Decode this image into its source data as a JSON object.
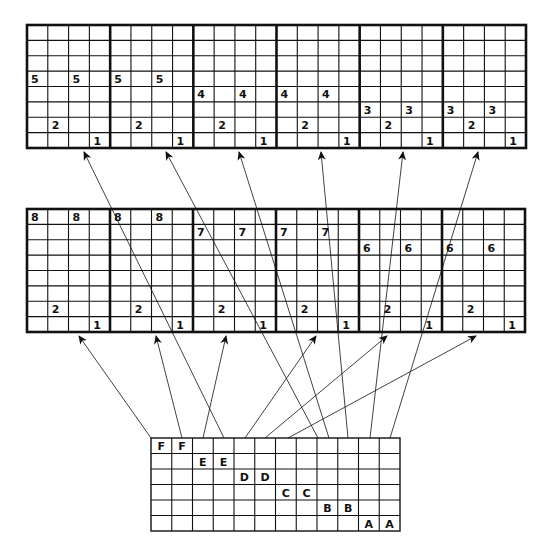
{
  "diagram": {
    "title": "",
    "colors": {
      "line": "#111111",
      "background": "#ffffff"
    },
    "top_grid": {
      "x": 27,
      "y": 25,
      "width": 499,
      "height": 123,
      "blocks": 6,
      "cols_per_block": 4,
      "rows": 8,
      "labels": [
        {
          "block": 0,
          "col": 0,
          "row": 3,
          "text": "5"
        },
        {
          "block": 0,
          "col": 2,
          "row": 3,
          "text": "5"
        },
        {
          "block": 0,
          "col": 1,
          "row": 6,
          "text": "2"
        },
        {
          "block": 0,
          "col": 3,
          "row": 7,
          "text": "1"
        },
        {
          "block": 1,
          "col": 0,
          "row": 3,
          "text": "5"
        },
        {
          "block": 1,
          "col": 2,
          "row": 3,
          "text": "5"
        },
        {
          "block": 1,
          "col": 1,
          "row": 6,
          "text": "2"
        },
        {
          "block": 1,
          "col": 3,
          "row": 7,
          "text": "1"
        },
        {
          "block": 2,
          "col": 0,
          "row": 4,
          "text": "4"
        },
        {
          "block": 2,
          "col": 2,
          "row": 4,
          "text": "4"
        },
        {
          "block": 2,
          "col": 1,
          "row": 6,
          "text": "2"
        },
        {
          "block": 2,
          "col": 3,
          "row": 7,
          "text": "1"
        },
        {
          "block": 3,
          "col": 0,
          "row": 4,
          "text": "4"
        },
        {
          "block": 3,
          "col": 2,
          "row": 4,
          "text": "4"
        },
        {
          "block": 3,
          "col": 1,
          "row": 6,
          "text": "2"
        },
        {
          "block": 3,
          "col": 3,
          "row": 7,
          "text": "1"
        },
        {
          "block": 4,
          "col": 0,
          "row": 5,
          "text": "3"
        },
        {
          "block": 4,
          "col": 2,
          "row": 5,
          "text": "3"
        },
        {
          "block": 4,
          "col": 1,
          "row": 6,
          "text": "2"
        },
        {
          "block": 4,
          "col": 3,
          "row": 7,
          "text": "1"
        },
        {
          "block": 5,
          "col": 0,
          "row": 5,
          "text": "3"
        },
        {
          "block": 5,
          "col": 2,
          "row": 5,
          "text": "3"
        },
        {
          "block": 5,
          "col": 1,
          "row": 6,
          "text": "2"
        },
        {
          "block": 5,
          "col": 3,
          "row": 7,
          "text": "1"
        }
      ]
    },
    "middle_grid": {
      "x": 27,
      "y": 209,
      "width": 498,
      "height": 123,
      "blocks": 6,
      "cols_per_block": 4,
      "rows": 8,
      "labels": [
        {
          "block": 0,
          "col": 0,
          "row": 0,
          "text": "8"
        },
        {
          "block": 0,
          "col": 2,
          "row": 0,
          "text": "8"
        },
        {
          "block": 0,
          "col": 1,
          "row": 6,
          "text": "2"
        },
        {
          "block": 0,
          "col": 3,
          "row": 7,
          "text": "1"
        },
        {
          "block": 1,
          "col": 0,
          "row": 0,
          "text": "8"
        },
        {
          "block": 1,
          "col": 2,
          "row": 0,
          "text": "8"
        },
        {
          "block": 1,
          "col": 1,
          "row": 6,
          "text": "2"
        },
        {
          "block": 1,
          "col": 3,
          "row": 7,
          "text": "1"
        },
        {
          "block": 2,
          "col": 0,
          "row": 1,
          "text": "7"
        },
        {
          "block": 2,
          "col": 2,
          "row": 1,
          "text": "7"
        },
        {
          "block": 2,
          "col": 1,
          "row": 6,
          "text": "2"
        },
        {
          "block": 2,
          "col": 3,
          "row": 7,
          "text": "1"
        },
        {
          "block": 3,
          "col": 0,
          "row": 1,
          "text": "7"
        },
        {
          "block": 3,
          "col": 2,
          "row": 1,
          "text": "7"
        },
        {
          "block": 3,
          "col": 1,
          "row": 6,
          "text": "2"
        },
        {
          "block": 3,
          "col": 3,
          "row": 7,
          "text": "1"
        },
        {
          "block": 4,
          "col": 0,
          "row": 2,
          "text": "6"
        },
        {
          "block": 4,
          "col": 2,
          "row": 2,
          "text": "6"
        },
        {
          "block": 4,
          "col": 1,
          "row": 6,
          "text": "2"
        },
        {
          "block": 4,
          "col": 3,
          "row": 7,
          "text": "1"
        },
        {
          "block": 5,
          "col": 0,
          "row": 2,
          "text": "6"
        },
        {
          "block": 5,
          "col": 2,
          "row": 2,
          "text": "6"
        },
        {
          "block": 5,
          "col": 1,
          "row": 6,
          "text": "2"
        },
        {
          "block": 5,
          "col": 3,
          "row": 7,
          "text": "1"
        }
      ]
    },
    "bottom_grid": {
      "x": 151,
      "y": 438,
      "width": 249,
      "height": 93,
      "cols": 12,
      "rows": 6,
      "labels": [
        {
          "col": 0,
          "row": 0,
          "text": "F"
        },
        {
          "col": 1,
          "row": 0,
          "text": "F"
        },
        {
          "col": 2,
          "row": 1,
          "text": "E"
        },
        {
          "col": 3,
          "row": 1,
          "text": "E"
        },
        {
          "col": 4,
          "row": 2,
          "text": "D"
        },
        {
          "col": 5,
          "row": 2,
          "text": "D"
        },
        {
          "col": 6,
          "row": 3,
          "text": "C"
        },
        {
          "col": 7,
          "row": 3,
          "text": "C"
        },
        {
          "col": 8,
          "row": 4,
          "text": "B"
        },
        {
          "col": 9,
          "row": 4,
          "text": "B"
        },
        {
          "col": 10,
          "row": 5,
          "text": "A"
        },
        {
          "col": 11,
          "row": 5,
          "text": "A"
        }
      ]
    },
    "arrows": [
      {
        "from": [
          151,
          438
        ],
        "to": [
          79,
          336
        ],
        "target": "middle-block-1"
      },
      {
        "from": [
          182,
          438
        ],
        "to": [
          156,
          336
        ],
        "target": "middle-block-2"
      },
      {
        "from": [
          203,
          438
        ],
        "to": [
          226,
          336
        ],
        "target": "middle-block-3"
      },
      {
        "from": [
          245,
          438
        ],
        "to": [
          316,
          336
        ],
        "target": "middle-block-4"
      },
      {
        "from": [
          265,
          438
        ],
        "to": [
          387,
          336
        ],
        "target": "middle-block-5"
      },
      {
        "from": [
          288,
          438
        ],
        "to": [
          476,
          336
        ],
        "target": "middle-block-6"
      },
      {
        "from": [
          224,
          438
        ],
        "to": [
          84,
          152
        ],
        "target": "top-block-1"
      },
      {
        "from": [
          318,
          438
        ],
        "to": [
          166,
          152
        ],
        "target": "top-block-2"
      },
      {
        "from": [
          329,
          438
        ],
        "to": [
          239,
          152
        ],
        "target": "top-block-3"
      },
      {
        "from": [
          348,
          438
        ],
        "to": [
          321,
          152
        ],
        "target": "top-block-4"
      },
      {
        "from": [
          370,
          438
        ],
        "to": [
          403,
          152
        ],
        "target": "top-block-5"
      },
      {
        "from": [
          390,
          438
        ],
        "to": [
          478,
          152
        ],
        "target": "top-block-6"
      }
    ]
  }
}
